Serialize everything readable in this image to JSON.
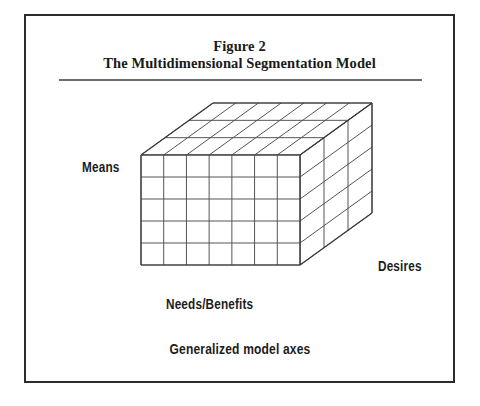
{
  "figure": {
    "caption_line_1": "Figure 2",
    "caption_line_2": "The Multidimensional Segmentation Model",
    "footer_label": "Generalized model axes",
    "border_color": "#2b2b2b",
    "rule_color": "#6d6d6d",
    "background": "#ffffff",
    "text_color": "#1a1a1a"
  },
  "axes": {
    "vertical_label": "Means",
    "horizontal_label": "Needs/Benefits",
    "depth_label": "Desires"
  },
  "chart_data": {
    "type": "diagram",
    "title": "The Multidimensional Segmentation Model",
    "subtitle": "Figure 2",
    "shape": "3d-grid-cuboid",
    "annotation": "Generalized model axes",
    "axis_names": [
      "Means",
      "Needs/Benefits",
      "Desires"
    ],
    "grid_divisions": {
      "width_columns": 7,
      "height_rows": 5,
      "depth_layers": 3
    },
    "geometry": {
      "front_face": {
        "left": 141,
        "top": 155,
        "width": 159,
        "height": 110
      },
      "depth_offset_x": 72,
      "depth_offset_y": -52
    },
    "stroke_color": "#555555",
    "outline_color": "#3a3a3a",
    "face_fill": "#ffffff"
  }
}
